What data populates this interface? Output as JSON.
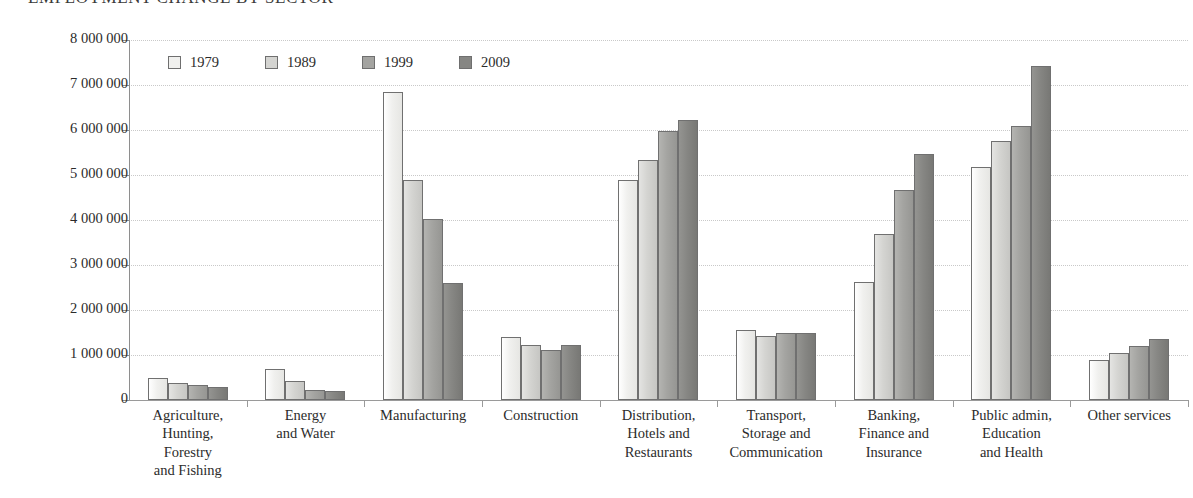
{
  "chart_data": {
    "type": "bar",
    "title": "EMPLOYMENT CHANGE BY SECTOR",
    "xlabel": "",
    "ylabel": "",
    "ylim": [
      0,
      8000000
    ],
    "grid": true,
    "legend_position": "top-left-inside",
    "categories": [
      "Agriculture, Hunting, Forestry and Fishing",
      "Energy and Water",
      "Manufacturing",
      "Construction",
      "Distribution, Hotels and Restaurants",
      "Transport, Storage and Communication",
      "Banking, Finance and Insurance",
      "Public admin, Education and Health",
      "Other services"
    ],
    "category_lines": [
      [
        "Agriculture,",
        "Hunting,",
        "Forestry",
        "and Fishing"
      ],
      [
        "Energy",
        "and Water"
      ],
      [
        "Manufacturing"
      ],
      [
        "Construction"
      ],
      [
        "Distribution,",
        "Hotels and",
        "Restaurants"
      ],
      [
        "Transport,",
        "Storage and",
        "Communication"
      ],
      [
        "Banking,",
        "Finance and",
        "Insurance"
      ],
      [
        "Public admin,",
        "Education",
        "and Health"
      ],
      [
        "Other services"
      ]
    ],
    "series": [
      {
        "name": "1979",
        "color": "#f0f0ee",
        "values": [
          490000,
          690000,
          6850000,
          1390000,
          4880000,
          1550000,
          2620000,
          5170000,
          890000
        ]
      },
      {
        "name": "1989",
        "color": "#d4d4d1",
        "values": [
          380000,
          430000,
          4900000,
          1230000,
          5330000,
          1420000,
          3680000,
          5750000,
          1050000
        ]
      },
      {
        "name": "1999",
        "color": "#a4a4a1",
        "values": [
          340000,
          220000,
          4020000,
          1120000,
          5980000,
          1480000,
          4670000,
          6080000,
          1210000
        ]
      },
      {
        "name": "2009",
        "color": "#868683",
        "values": [
          290000,
          190000,
          2600000,
          1220000,
          6220000,
          1500000,
          5470000,
          7430000,
          1350000
        ]
      }
    ],
    "y_ticks": [
      0,
      1000000,
      2000000,
      3000000,
      4000000,
      5000000,
      6000000,
      7000000,
      8000000
    ],
    "y_tick_labels": [
      "0",
      "1 000 000",
      "2 000 000",
      "3 000 000",
      "4 000 000",
      "5 000 000",
      "6 000 000",
      "7 000 000",
      "8 000 000"
    ]
  }
}
